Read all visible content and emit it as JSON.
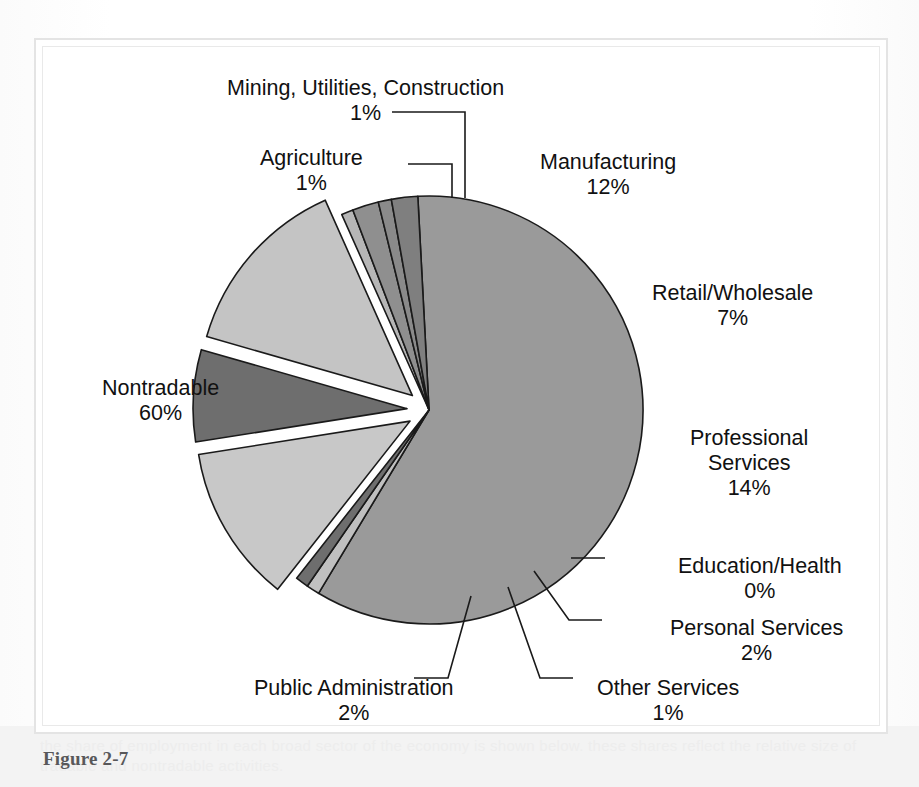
{
  "figure": {
    "caption": "Figure 2-7"
  },
  "page": {
    "bleed_through_text": "the share of employment in each broad sector of the economy is shown below. these shares reflect the relative size of tradable and nontradable activities."
  },
  "chart_data": {
    "type": "pie",
    "title": "",
    "subtitle": "",
    "xlabel": "",
    "ylabel": "",
    "legend_position": "callout-labels",
    "grid": false,
    "value_unit": "percent",
    "total": 100,
    "categories": [
      "Nontradable",
      "Agriculture",
      "Mining, Utilities, Construction",
      "Manufacturing",
      "Retail/Wholesale",
      "Professional Services",
      "Education/Health",
      "Personal Services",
      "Other Services",
      "Public Administration"
    ],
    "values": [
      60,
      1,
      1,
      12,
      7,
      14,
      0,
      2,
      1,
      2
    ],
    "slices": [
      {
        "label": "Nontradable",
        "value": 60,
        "percent_text": "60%",
        "color": "#9a9a9a",
        "exploded": false,
        "label_position": "left",
        "label_align": "center",
        "label_x": 60,
        "label_y": 330,
        "leader": false
      },
      {
        "label": "Agriculture",
        "value": 1,
        "percent_text": "1%",
        "color": "#c0c0c0",
        "exploded": false,
        "label_position": "top-left",
        "label_align": "center",
        "label_x": 218,
        "label_y": 100,
        "leader": true,
        "leader_path": "M 366 118 L 410 118 L 410 152"
      },
      {
        "label": "Mining, Utilities, Construction",
        "value": 1,
        "percent_text": "1%",
        "color": "#6e6e6e",
        "exploded": false,
        "label_position": "top",
        "label_align": "center",
        "label_x": 185,
        "label_y": 30,
        "leader": true,
        "leader_path": "M 350 66 L 423 66 L 423 152"
      },
      {
        "label": "Manufacturing",
        "value": 12,
        "percent_text": "12%",
        "color": "#c8c8c8",
        "exploded": true,
        "label_position": "top-right",
        "label_align": "center",
        "label_x": 498,
        "label_y": 104,
        "leader": false
      },
      {
        "label": "Retail/Wholesale",
        "value": 7,
        "percent_text": "7%",
        "color": "#6e6e6e",
        "exploded": true,
        "label_position": "right",
        "label_align": "center",
        "label_x": 610,
        "label_y": 235,
        "leader": false
      },
      {
        "label": "Professional Services",
        "value": 14,
        "percent_text": "14%",
        "color": "#c4c4c4",
        "exploded": true,
        "label_position": "right",
        "label_align": "center",
        "label_x": 648,
        "label_y": 380,
        "leader": false
      },
      {
        "label": "Education/Health",
        "value": 0,
        "percent_text": "0%",
        "color": "#b6b6b6",
        "exploded": false,
        "label_position": "bottom-right",
        "label_align": "center",
        "label_x": 636,
        "label_y": 508,
        "leader": true,
        "leader_path": "M 529 512 L 563 512"
      },
      {
        "label": "Personal Services",
        "value": 2,
        "percent_text": "2%",
        "color": "#8f8f8f",
        "exploded": false,
        "label_position": "bottom-right",
        "label_align": "center",
        "label_x": 628,
        "label_y": 570,
        "leader": true,
        "leader_path": "M 492 525 L 527 574 L 560 574"
      },
      {
        "label": "Other Services",
        "value": 1,
        "percent_text": "1%",
        "color": "#8a8a8a",
        "exploded": false,
        "label_position": "bottom",
        "label_align": "center",
        "label_x": 555,
        "label_y": 630,
        "leader": true,
        "leader_path": "M 466 541 L 498 632 L 531 632"
      },
      {
        "label": "Public Administration",
        "value": 2,
        "percent_text": "2%",
        "color": "#7f7f7f",
        "exploded": false,
        "label_position": "bottom-left",
        "label_align": "center",
        "label_x": 212,
        "label_y": 630,
        "leader": true,
        "leader_path": "M 429 550 L 406 632 L 372 632"
      }
    ],
    "geometry": {
      "center_x": 387,
      "center_y": 364,
      "radius": 214,
      "start_angle_deg": -93,
      "explode_offset": 22,
      "slice_outline_color": "#1a1a1a",
      "slice_outline_width": 1.6,
      "leader_color": "#1a1a1a",
      "leader_width": 1.6
    }
  }
}
